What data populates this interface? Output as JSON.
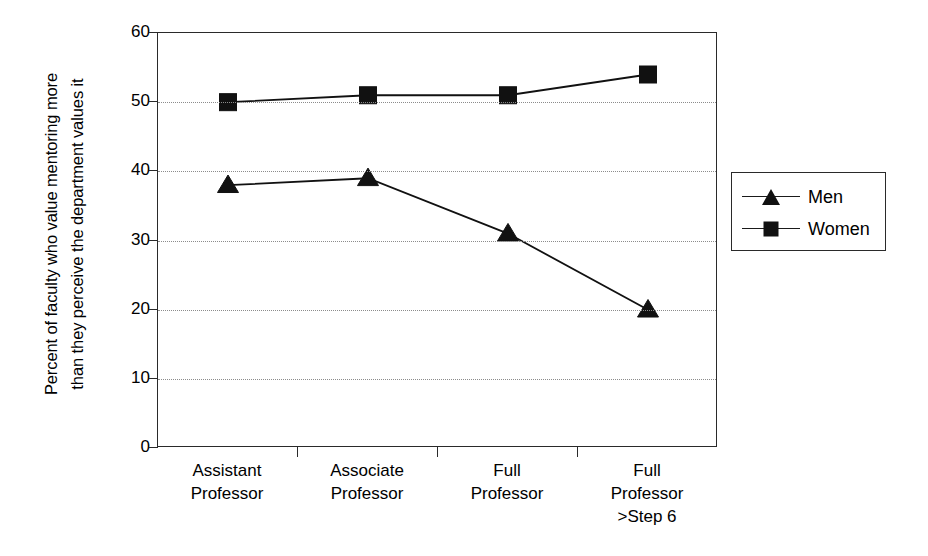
{
  "chart_data": {
    "type": "line",
    "title": "",
    "xlabel": "",
    "ylabel": "Percent of faculty who value mentoring more than they perceive the department values it",
    "ylabel_lines": [
      "Percent of faculty who value mentoring more",
      "than they perceive the department values it"
    ],
    "categories": [
      "Assistant Professor",
      "Associate Professor",
      "Full Professor",
      "Full Professor >Step 6"
    ],
    "category_lines": [
      [
        "Assistant",
        "Professor"
      ],
      [
        "Associate",
        "Professor"
      ],
      [
        "Full",
        "Professor"
      ],
      [
        "Full",
        "Professor",
        ">Step 6"
      ]
    ],
    "series": [
      {
        "name": "Men",
        "marker": "triangle",
        "color": "#111111",
        "values": [
          38,
          39,
          31,
          20
        ]
      },
      {
        "name": "Women",
        "marker": "square",
        "color": "#111111",
        "values": [
          50,
          51,
          51,
          54
        ]
      }
    ],
    "ylim": [
      0,
      60
    ],
    "ytick_step": 10,
    "yticks": [
      0,
      10,
      20,
      30,
      40,
      50,
      60
    ],
    "ytick_labels": [
      "0",
      "10",
      "20",
      "30",
      "40",
      "50",
      "60"
    ],
    "grid": true,
    "grid_style": "dotted",
    "grid_color": "#8c8c8c",
    "legend_position": "right",
    "legend_entries": [
      "Men",
      "Women"
    ],
    "axis_color": "#2a2a2a",
    "background": "#ffffff"
  }
}
